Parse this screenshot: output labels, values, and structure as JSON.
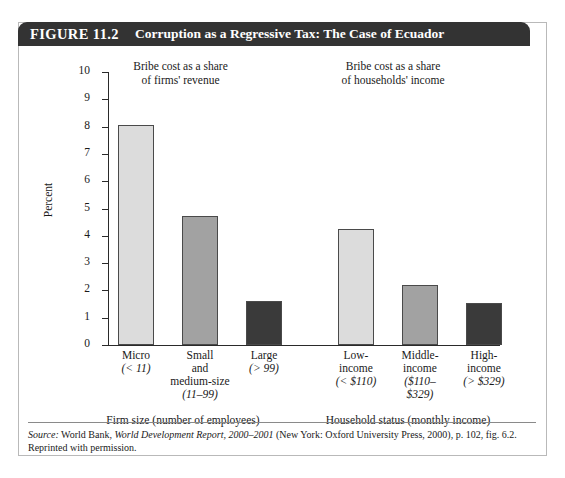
{
  "figure": {
    "number": "FIGURE 11.2",
    "title": "Corruption as a Regressive Tax: The Case of Ecuador"
  },
  "annotations": {
    "firms": "Bribe cost as a share\nof firms' revenue",
    "households": "Bribe cost as a share\nof households' income"
  },
  "axis": {
    "y_title": "Percent",
    "ticks": [
      "0",
      "1",
      "2",
      "3",
      "4",
      "5",
      "6",
      "7",
      "8",
      "9",
      "10"
    ]
  },
  "groups": {
    "firm": "Firm size (number of employees)",
    "household": "Household status (monthly income)"
  },
  "source": {
    "prefix": "Source:",
    "line1_a": " World Bank, ",
    "line1_italic": "World Development Report, 2000–2001",
    "line1_b": " (New York: Oxford University Press, 2000), p. 102, fig. 6.2.",
    "line2": "Reprinted with permission."
  },
  "colors": {
    "light": "#dcdcdc",
    "medium": "#a2a2a2",
    "dark": "#3a3a3a",
    "banner": "#333333",
    "frame": "#b9b9b9",
    "axis": "#2a2a2a"
  },
  "chart_data": {
    "type": "bar",
    "title": "Corruption as a Regressive Tax: The Case of Ecuador",
    "xlabel": "",
    "ylabel": "Percent",
    "ylim": [
      0,
      10
    ],
    "yticks": [
      0,
      1,
      2,
      3,
      4,
      5,
      6,
      7,
      8,
      9,
      10
    ],
    "grid": false,
    "legend": false,
    "categories": [
      "Micro (< 11)",
      "Small and medium-size (11–99)",
      "Large (> 99)",
      "Low-income (< $110)",
      "Middle-income ($110–$329)",
      "High-income (> $329)"
    ],
    "values": [
      8.05,
      4.73,
      1.6,
      4.25,
      2.2,
      1.55
    ],
    "bar_colors": [
      "#dcdcdc",
      "#a2a2a2",
      "#3a3a3a",
      "#dcdcdc",
      "#a2a2a2",
      "#3a3a3a"
    ],
    "annotations": [
      "Bribe cost as a share of firms' revenue",
      "Bribe cost as a share of households' income"
    ],
    "groups": [
      {
        "label": "Firm size (number of employees)",
        "categories": [
          0,
          1,
          2
        ]
      },
      {
        "label": "Household status (monthly income)",
        "categories": [
          3,
          4,
          5
        ]
      }
    ]
  },
  "bars": [
    {
      "name": "Micro",
      "range": "(< 11)",
      "value": 8.05,
      "fill": "#dcdcdc",
      "x": 100,
      "w": 36
    },
    {
      "name": "Small\nand\nmedium-size",
      "range": "(11–99)",
      "value": 4.73,
      "fill": "#a2a2a2",
      "x": 164,
      "w": 36
    },
    {
      "name": "Large",
      "range": "(> 99)",
      "value": 1.6,
      "fill": "#3a3a3a",
      "x": 228,
      "w": 36
    },
    {
      "name": "Low-\nincome",
      "range": "(< $110)",
      "value": 4.25,
      "fill": "#dcdcdc",
      "x": 320,
      "w": 36
    },
    {
      "name": "Middle-\nincome",
      "range": "($110–\n$329)",
      "value": 2.2,
      "fill": "#a2a2a2",
      "x": 384,
      "w": 36
    },
    {
      "name": "High-\nincome",
      "range": "(> $329)",
      "value": 1.55,
      "fill": "#3a3a3a",
      "x": 448,
      "w": 36
    }
  ]
}
